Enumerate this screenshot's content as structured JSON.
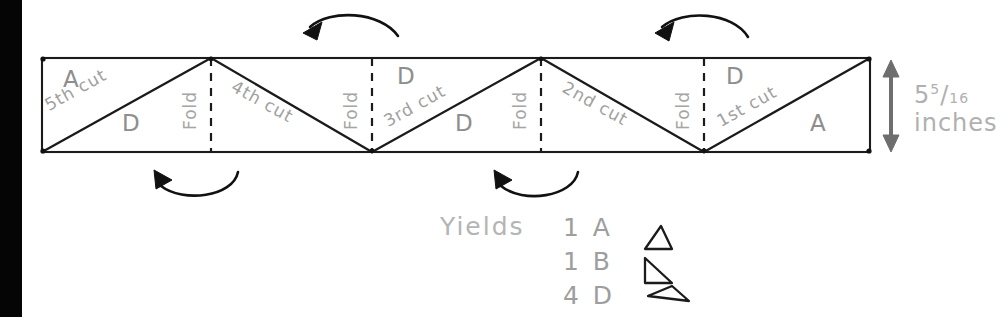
{
  "diagram": {
    "strip": {
      "label_left_top": "A",
      "label_left_bottom": "D",
      "panels": [
        {
          "letter_top": "A",
          "letter_bottom": "D",
          "cut": "5th cut",
          "fold": "Fold"
        },
        {
          "letter_top": "",
          "letter_bottom": "",
          "cut": "4th cut",
          "fold": "Fold"
        },
        {
          "letter_top": "D",
          "letter_bottom": "D",
          "cut": "3rd cut",
          "fold": "Fold"
        },
        {
          "letter_top": "",
          "letter_bottom": "",
          "cut": "2nd cut",
          "fold": "Fold"
        },
        {
          "letter_top": "D",
          "letter_bottom": "A",
          "cut": "1st cut",
          "fold": ""
        }
      ],
      "cut_labels": [
        "5th cut",
        "4th cut",
        "3rd cut",
        "2nd cut",
        "1st cut"
      ],
      "fold_labels": [
        "Fold",
        "Fold",
        "Fold",
        "Fold"
      ],
      "region_letters": [
        "A",
        "D",
        "D",
        "D",
        "D",
        "A"
      ]
    },
    "dimension": {
      "whole": "5",
      "numerator": "5",
      "slash": "/",
      "denominator": "16",
      "unit": "inches",
      "arrow": "double-headed-vertical-arrow"
    },
    "yields": {
      "heading": "Yields",
      "items": [
        {
          "count": "1",
          "piece": "A",
          "shape": "triangle-right-angle-bottom-right"
        },
        {
          "count": "1",
          "piece": "B",
          "shape": "triangle-right-angle-top-left"
        },
        {
          "count": "4",
          "piece": "D",
          "shape": "triangle-wide-obtuse"
        }
      ]
    },
    "arrows": {
      "top": [
        "curved-arrow-left-over",
        "curved-arrow-left-over"
      ],
      "bottom": [
        "curved-arrow-left-under",
        "curved-arrow-left-under"
      ]
    },
    "colors": {
      "ink": "#1a1a1a",
      "pencil": "#9a9a9a",
      "paper": "#ffffff",
      "margin_bar": "#050505"
    }
  }
}
